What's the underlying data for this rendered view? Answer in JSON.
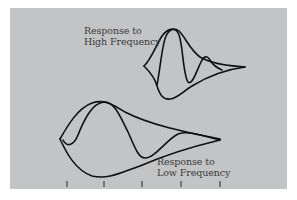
{
  "figure": {
    "background_color": "#c3c4c6",
    "stroke_color": "#111111",
    "labels": {
      "high": {
        "line1": "Response to",
        "line2": "High Frequency"
      },
      "low": {
        "line1": "Response to",
        "line2": "Low Frequency"
      }
    },
    "axis": {
      "tick_count": 5,
      "tick_positions_px": [
        67,
        104,
        142,
        181,
        220
      ]
    },
    "curves": [
      {
        "name": "high-frequency-response",
        "description": "traveling wave envelope peaking near the base (short, narrow)"
      },
      {
        "name": "low-frequency-response",
        "description": "traveling wave envelope peaking farther along (long, broad)"
      }
    ]
  }
}
